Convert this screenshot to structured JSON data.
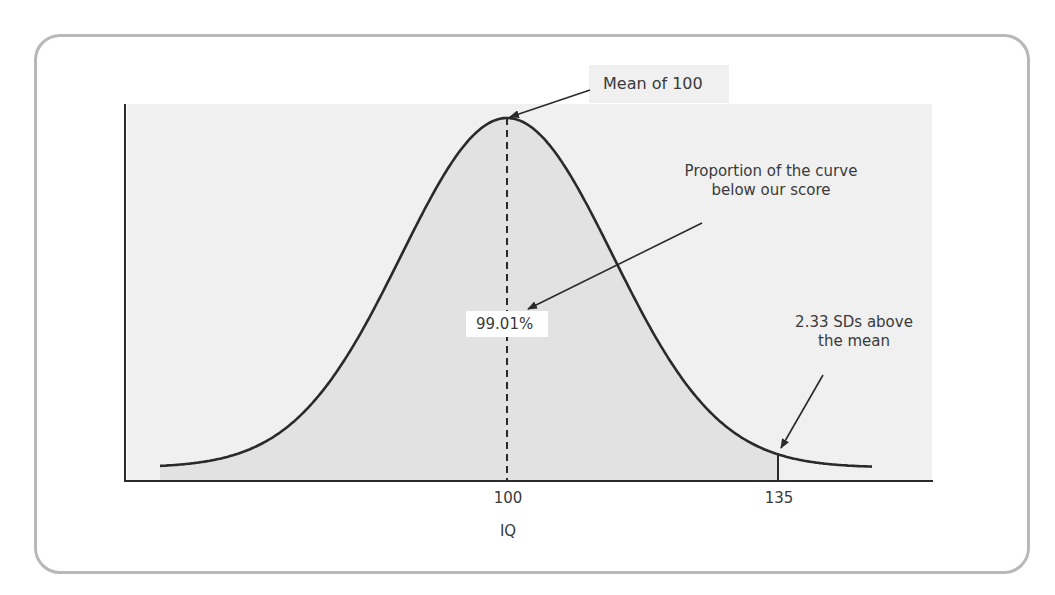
{
  "colors": {
    "card_border": "#b8b8b8",
    "plot_background": "#f0f0f0",
    "area_fill": "#e2e2e2",
    "curve": "#2a2a2a",
    "axis": "#2a2a2a",
    "text": "#3a3a3a"
  },
  "annotations": {
    "mean_label": "Mean of 100",
    "proportion_label_line1": "Proportion of the curve",
    "proportion_label_line2": "below our score",
    "percent_label": "99.01%",
    "sd_label_line1": "2.33 SDs above",
    "sd_label_line2": "the mean"
  },
  "axis": {
    "xlabel": "IQ",
    "ticks": [
      "100",
      "135"
    ]
  },
  "chart_data": {
    "type": "area",
    "title": "",
    "subtitle": "",
    "xlabel": "IQ",
    "ylabel": "",
    "distribution": "normal",
    "mean": 100,
    "score": 135,
    "z_score": 2.33,
    "proportion_below_score_percent": 99.01,
    "x_ticks": [
      100,
      135
    ],
    "x_tick_labels": [
      "100",
      "135"
    ],
    "shaded_region": {
      "from": "left tail",
      "to": 135
    },
    "reference_lines": [
      {
        "x": 100,
        "style": "dashed",
        "label": "Mean of 100"
      },
      {
        "x": 135,
        "style": "solid",
        "label": "2.33 SDs above the mean"
      }
    ],
    "annotations": [
      "Mean of 100",
      "Proportion of the curve below our score",
      "99.01%",
      "2.33 SDs above the mean"
    ],
    "grid": false,
    "legend": null
  }
}
